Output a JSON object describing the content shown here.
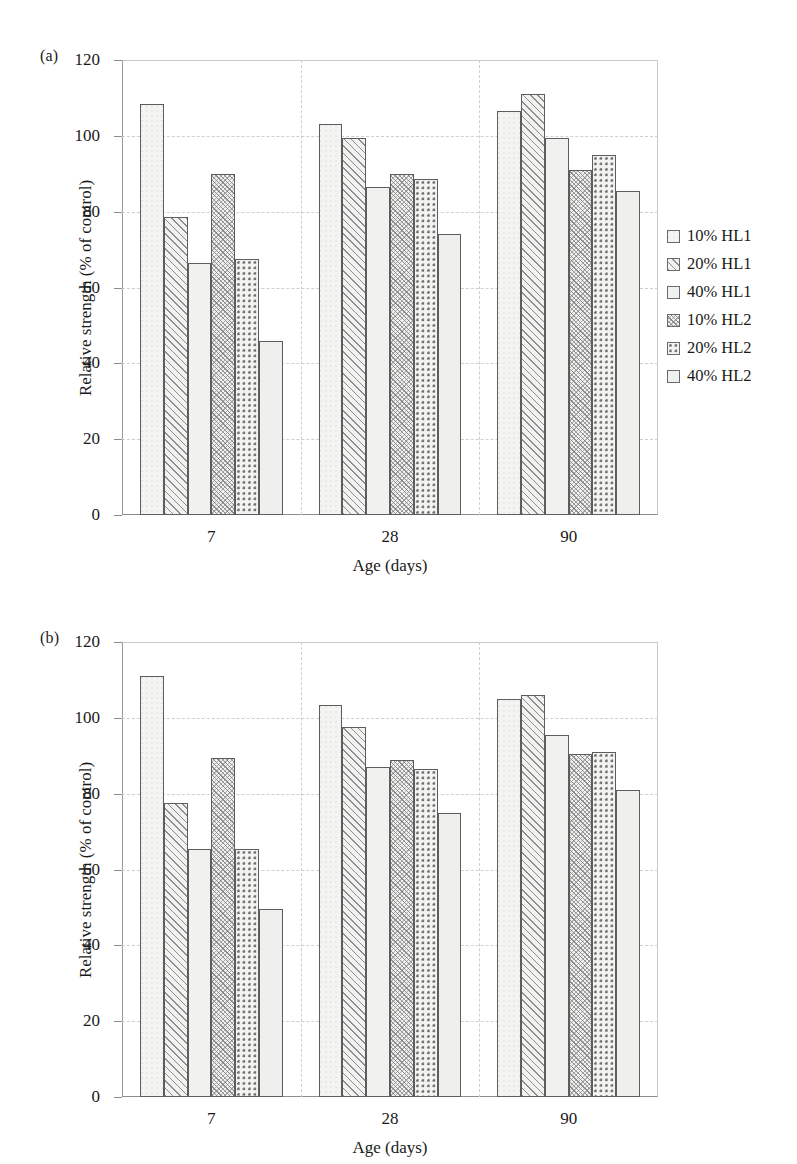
{
  "figure": {
    "panels": [
      {
        "letter": "(a)",
        "xlabel": "Age (days)",
        "ylabel": "Relative strength (% of control)",
        "yticks": [
          "0",
          "20",
          "40",
          "60",
          "80",
          "100",
          "120"
        ],
        "xticks": [
          "7",
          "28",
          "90"
        ]
      },
      {
        "letter": "(b)",
        "xlabel": "Age (days)",
        "ylabel": "Relative strength (% of control)",
        "yticks": [
          "0",
          "20",
          "40",
          "60",
          "80",
          "100",
          "120"
        ],
        "xticks": [
          "7",
          "28",
          "90"
        ]
      }
    ],
    "legend": [
      {
        "label": "10% HL1",
        "pattern": "blank-square-swatch"
      },
      {
        "label": "20% HL1",
        "pattern": "diagonal-hatch-swatch"
      },
      {
        "label": "40% HL1",
        "pattern": "blank-square-swatch"
      },
      {
        "label": "10% HL2",
        "pattern": "cross-weave-swatch"
      },
      {
        "label": "20% HL2",
        "pattern": "dotted-grid-swatch"
      },
      {
        "label": "40% HL2",
        "pattern": "light-grey-swatch"
      }
    ]
  },
  "chart_data": [
    {
      "type": "bar",
      "panel": "(a)",
      "title": "",
      "xlabel": "Age (days)",
      "ylabel": "Relative strength (% of control)",
      "ylim": [
        0,
        120
      ],
      "yticks": [
        0,
        20,
        40,
        60,
        80,
        100,
        120
      ],
      "grid": true,
      "legend_position": "right",
      "categories": [
        "7",
        "28",
        "90"
      ],
      "series": [
        {
          "name": "10% HL1",
          "values": [
            108.4,
            103.0,
            106.5
          ]
        },
        {
          "name": "20% HL1",
          "values": [
            78.5,
            99.5,
            111.0
          ]
        },
        {
          "name": "40% HL1",
          "values": [
            66.5,
            86.5,
            99.5
          ]
        },
        {
          "name": "10% HL2",
          "values": [
            90.0,
            90.0,
            91.0
          ]
        },
        {
          "name": "20% HL2",
          "values": [
            67.5,
            88.5,
            95.0
          ]
        },
        {
          "name": "40% HL2",
          "values": [
            46.0,
            74.0,
            85.5
          ]
        }
      ]
    },
    {
      "type": "bar",
      "panel": "(b)",
      "title": "",
      "xlabel": "Age (days)",
      "ylabel": "Relative strength (% of control)",
      "ylim": [
        0,
        120
      ],
      "yticks": [
        0,
        20,
        40,
        60,
        80,
        100,
        120
      ],
      "grid": true,
      "legend_position": "right",
      "categories": [
        "7",
        "28",
        "90"
      ],
      "series": [
        {
          "name": "10% HL1",
          "values": [
            111.0,
            103.5,
            105.0
          ]
        },
        {
          "name": "20% HL1",
          "values": [
            77.5,
            97.5,
            106.0
          ]
        },
        {
          "name": "40% HL1",
          "values": [
            65.5,
            87.0,
            95.5
          ]
        },
        {
          "name": "10% HL2",
          "values": [
            89.5,
            89.0,
            90.5
          ]
        },
        {
          "name": "20% HL2",
          "values": [
            65.5,
            86.5,
            91.0
          ]
        },
        {
          "name": "40% HL2",
          "values": [
            49.5,
            75.0,
            81.0
          ]
        }
      ]
    }
  ]
}
